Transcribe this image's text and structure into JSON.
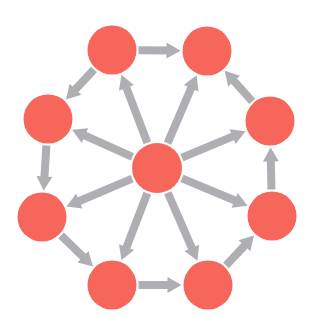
{
  "diagram": {
    "title": "",
    "width": 313,
    "height": 326,
    "colors": {
      "background": "#ffffff",
      "node_fill": "#f7665a",
      "edge": "#afaeb3"
    },
    "node_radius": 24.5,
    "edge_width": 8,
    "nodes": [
      {
        "id": "center",
        "label": "",
        "x": 157,
        "y": 168,
        "r": 25
      },
      {
        "id": "top-left",
        "label": "",
        "x": 112,
        "y": 50
      },
      {
        "id": "top-right",
        "label": "",
        "x": 207,
        "y": 51
      },
      {
        "id": "right-upper",
        "label": "",
        "x": 270,
        "y": 121
      },
      {
        "id": "right-lower",
        "label": "",
        "x": 272,
        "y": 216
      },
      {
        "id": "bottom-right",
        "label": "",
        "x": 208,
        "y": 285
      },
      {
        "id": "bottom-left",
        "label": "",
        "x": 112,
        "y": 285
      },
      {
        "id": "left-lower",
        "label": "",
        "x": 42,
        "y": 217
      },
      {
        "id": "left-upper",
        "label": "",
        "x": 48,
        "y": 119
      }
    ],
    "edges": [
      {
        "from": "center",
        "to": "top-left"
      },
      {
        "from": "center",
        "to": "top-right"
      },
      {
        "from": "center",
        "to": "right-upper"
      },
      {
        "from": "center",
        "to": "right-lower"
      },
      {
        "from": "center",
        "to": "bottom-right"
      },
      {
        "from": "center",
        "to": "bottom-left"
      },
      {
        "from": "center",
        "to": "left-lower"
      },
      {
        "from": "center",
        "to": "left-upper"
      },
      {
        "from": "top-left",
        "to": "top-right"
      },
      {
        "from": "right-upper",
        "to": "top-right"
      },
      {
        "from": "right-lower",
        "to": "right-upper"
      },
      {
        "from": "bottom-right",
        "to": "right-lower"
      },
      {
        "from": "bottom-left",
        "to": "bottom-right"
      },
      {
        "from": "left-lower",
        "to": "bottom-left"
      },
      {
        "from": "left-upper",
        "to": "left-lower"
      },
      {
        "from": "top-left",
        "to": "left-upper"
      }
    ]
  }
}
